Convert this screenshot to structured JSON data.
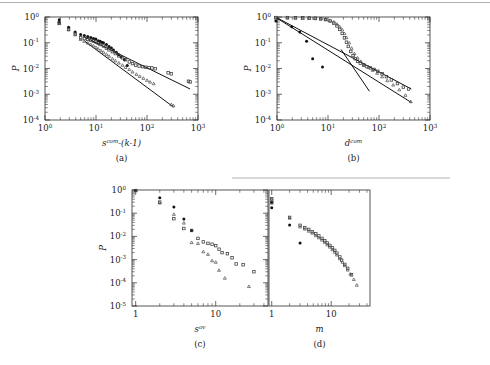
{
  "figure": {
    "background": "#ffffff",
    "ink_color": "#1a1a1a",
    "panels": [
      "a",
      "b",
      "c",
      "d"
    ]
  },
  "panel_a": {
    "label": "(a)",
    "xlabel_base": "s",
    "xlabel_sup": "com",
    "xlabel_rest": "-(k-1)",
    "ylabel": "P",
    "xticks": [
      "10",
      "10",
      "10",
      "10"
    ],
    "xtick_sups": [
      "0",
      "1",
      "2",
      "3"
    ],
    "yticks": [
      "10",
      "10",
      "10",
      "10",
      "10"
    ],
    "ytick_sups": [
      "0",
      "-1",
      "-2",
      "-3",
      "-4"
    ]
  },
  "panel_b": {
    "label": "(b)",
    "xlabel_base": "d",
    "xlabel_sup": "com",
    "xlabel_rest": "",
    "ylabel": "P",
    "xticks": [
      "10",
      "10",
      "10",
      "10"
    ],
    "xtick_sups": [
      "0",
      "1",
      "2",
      "3"
    ],
    "yticks": [
      "10",
      "10",
      "10",
      "10",
      "10"
    ],
    "ytick_sups": [
      "0",
      "-1",
      "-2",
      "-3",
      "-4"
    ]
  },
  "panel_c": {
    "label": "(c)",
    "xlabel_base": "s",
    "xlabel_sup": "ov",
    "xlabel_rest": "",
    "ylabel": "P",
    "xticks": [
      "1",
      "10"
    ],
    "xtick_sups": [
      "",
      ""
    ],
    "yticks": [
      "10",
      "10",
      "10",
      "10",
      "10",
      "10"
    ],
    "ytick_sups": [
      "0",
      "-1",
      "-2",
      "-3",
      "-4",
      "-5"
    ]
  },
  "panel_d": {
    "label": "(d)",
    "xlabel_base": "m",
    "xlabel_sup": "",
    "xlabel_rest": "",
    "ylabel": "",
    "xticks": [
      "1",
      "10"
    ],
    "xtick_sups": [
      "",
      ""
    ],
    "yticks": [],
    "ytick_sups": []
  },
  "chart_data": [
    {
      "id": "a",
      "type": "scatter",
      "title": "",
      "xlabel": "s^com-(k-1)",
      "ylabel": "P",
      "xscale": "log",
      "yscale": "log",
      "xlim": [
        1,
        1000
      ],
      "ylim": [
        0.0001,
        1
      ],
      "grid": false,
      "legend": "none",
      "series": [
        {
          "name": "filled-circle",
          "marker": "filled circle",
          "x": [
            1.9,
            1.9,
            2.9,
            3.9,
            5.0,
            5.9,
            6.9,
            7.9,
            8.9,
            9.9,
            11,
            12,
            13,
            14,
            16,
            18,
            20,
            22,
            25,
            28,
            31,
            36,
            41
          ],
          "y": [
            0.78,
            0.62,
            0.4,
            0.26,
            0.21,
            0.19,
            0.175,
            0.16,
            0.145,
            0.14,
            0.12,
            0.115,
            0.105,
            0.1,
            0.085,
            0.072,
            0.062,
            0.052,
            0.043,
            0.034,
            0.028,
            0.022,
            0.013
          ]
        },
        {
          "name": "open-square",
          "marker": "open square",
          "x": [
            1.9,
            2.9,
            3.9,
            5.0,
            5.9,
            6.9,
            7.9,
            8.9,
            10,
            11,
            12,
            14,
            16,
            18,
            21,
            24,
            28,
            33,
            38,
            45,
            52,
            60,
            70,
            82,
            95,
            110,
            125,
            145,
            260,
            300,
            650,
            700
          ],
          "y": [
            0.58,
            0.33,
            0.22,
            0.155,
            0.145,
            0.135,
            0.125,
            0.115,
            0.105,
            0.095,
            0.085,
            0.075,
            0.062,
            0.053,
            0.045,
            0.038,
            0.031,
            0.026,
            0.022,
            0.018,
            0.0155,
            0.0135,
            0.0125,
            0.0118,
            0.0112,
            0.0108,
            0.0105,
            0.0098,
            0.0068,
            0.0062,
            0.0032,
            0.003
          ]
        },
        {
          "name": "open-triangle",
          "marker": "open triangle",
          "x": [
            1.9,
            2.9,
            3.9,
            5.0,
            5.9,
            6.9,
            7.9,
            8.9,
            10,
            11,
            12.5,
            14,
            16,
            18,
            21,
            24,
            28,
            33,
            38,
            45,
            52,
            62,
            72,
            85,
            100,
            115,
            135,
            300,
            330
          ],
          "y": [
            0.56,
            0.32,
            0.205,
            0.135,
            0.115,
            0.098,
            0.086,
            0.076,
            0.066,
            0.058,
            0.05,
            0.043,
            0.036,
            0.03,
            0.024,
            0.02,
            0.0165,
            0.0135,
            0.0112,
            0.0092,
            0.0074,
            0.006,
            0.005,
            0.0042,
            0.0035,
            0.003,
            0.0026,
            0.0004,
            0.00036
          ]
        }
      ],
      "fits": [
        {
          "name": "upper-fit",
          "x1": 6.0,
          "y1": 0.165,
          "x2": 700,
          "y2": 0.0016,
          "slope": -0.98
        },
        {
          "name": "lower-fit",
          "x1": 6.0,
          "y1": 0.115,
          "x2": 330,
          "y2": 0.00032,
          "slope": -1.46
        }
      ]
    },
    {
      "id": "b",
      "type": "scatter",
      "title": "",
      "xlabel": "d^com",
      "ylabel": "P",
      "xscale": "log",
      "yscale": "log",
      "xlim": [
        1,
        1000
      ],
      "ylim": [
        0.0001,
        1
      ],
      "grid": false,
      "legend": "none",
      "series": [
        {
          "name": "filled-circle",
          "marker": "filled circle",
          "x": [
            0.95,
            1.95,
            2.8,
            3.8,
            5.0,
            7.8
          ],
          "y": [
            0.7,
            0.42,
            0.26,
            0.115,
            0.024,
            0.0115
          ]
        },
        {
          "name": "open-square",
          "marker": "open square",
          "x": [
            0.95,
            1.6,
            2.3,
            3.2,
            4.3,
            5.6,
            7.2,
            9.0,
            11,
            13,
            15,
            17,
            19,
            21,
            23,
            25,
            28,
            31,
            34,
            38,
            43,
            50,
            58,
            68,
            80,
            95,
            115,
            140,
            175,
            230,
            300,
            380
          ],
          "y": [
            0.95,
            0.95,
            0.94,
            0.93,
            0.92,
            0.9,
            0.86,
            0.8,
            0.7,
            0.58,
            0.45,
            0.33,
            0.23,
            0.155,
            0.105,
            0.072,
            0.046,
            0.032,
            0.024,
            0.019,
            0.016,
            0.0135,
            0.0118,
            0.0105,
            0.0092,
            0.0078,
            0.0062,
            0.0048,
            0.0036,
            0.0026,
            0.0019,
            0.0016
          ]
        },
        {
          "name": "open-triangle",
          "marker": "open triangle",
          "x": [
            0.95,
            1.6,
            2.3,
            3.2,
            4.3,
            5.6,
            7.2,
            9.0,
            11,
            13,
            15,
            17,
            19,
            21,
            23,
            26,
            29,
            33,
            38,
            44,
            52,
            62,
            75,
            92,
            115,
            145,
            190,
            250,
            330,
            420
          ],
          "y": [
            0.92,
            0.92,
            0.91,
            0.9,
            0.89,
            0.87,
            0.84,
            0.8,
            0.73,
            0.64,
            0.53,
            0.42,
            0.32,
            0.23,
            0.16,
            0.1,
            0.062,
            0.038,
            0.026,
            0.019,
            0.0145,
            0.0112,
            0.0086,
            0.0066,
            0.0048,
            0.0034,
            0.0023,
            0.0015,
            0.00092,
            0.00052
          ]
        }
      ],
      "fits": [
        {
          "name": "upper-fit",
          "x1": 1.0,
          "y1": 0.93,
          "x2": 430,
          "y2": 0.0016,
          "slope": -1.05
        },
        {
          "name": "lower-fit",
          "x1": 1.0,
          "y1": 0.9,
          "x2": 430,
          "y2": 0.00048,
          "slope": -1.24
        },
        {
          "name": "steep-fit",
          "x1": 18,
          "y1": 0.055,
          "x2": 65,
          "y2": 0.0013,
          "slope": -2.9
        }
      ]
    },
    {
      "id": "c",
      "type": "scatter",
      "title": "",
      "xlabel": "s^ov",
      "ylabel": "P",
      "xscale": "log",
      "yscale": "log",
      "xlim": [
        0.9,
        45
      ],
      "ylim": [
        1e-05,
        1
      ],
      "grid": false,
      "legend": "none",
      "series": [
        {
          "name": "filled-circle",
          "marker": "filled circle",
          "x": [
            1.0,
            2.0,
            3.0,
            4.0,
            5.0
          ],
          "y": [
            0.95,
            0.46,
            0.185,
            0.056,
            0.018
          ]
        },
        {
          "name": "open-square",
          "marker": "open square",
          "x": [
            1.0,
            2.0,
            3.0,
            4.0,
            5.0,
            6.0,
            7.0,
            8.0,
            9.0,
            10,
            11,
            12,
            14,
            16,
            18,
            22,
            30
          ],
          "y": [
            0.95,
            0.3,
            0.058,
            0.022,
            0.018,
            0.0082,
            0.0058,
            0.005,
            0.0046,
            0.004,
            0.0028,
            0.002,
            0.0018,
            0.0012,
            0.00065,
            0.0006,
            0.0003
          ]
        },
        {
          "name": "open-triangle",
          "marker": "open triangle",
          "x": [
            1.0,
            2.0,
            3.0,
            4.0,
            5.0,
            6.0,
            7.0,
            8.0,
            9.0,
            10,
            11,
            13,
            26
          ],
          "y": [
            0.95,
            0.28,
            0.09,
            0.038,
            0.0055,
            0.005,
            0.0022,
            0.0017,
            0.0009,
            0.00078,
            0.00035,
            0.00016,
            7e-05
          ]
        }
      ],
      "fits": []
    },
    {
      "id": "d",
      "type": "scatter",
      "title": "",
      "xlabel": "m",
      "ylabel": "P",
      "xscale": "log",
      "yscale": "log",
      "xlim": [
        0.9,
        45
      ],
      "ylim": [
        1e-05,
        1
      ],
      "grid": false,
      "legend": "none",
      "series": [
        {
          "name": "filled-circle",
          "marker": "filled circle",
          "x": [
            1.0,
            1.0,
            2.0,
            3.0
          ],
          "y": [
            0.3,
            0.17,
            0.031,
            0.0052
          ]
        },
        {
          "name": "open-square",
          "marker": "open square",
          "x": [
            1.0,
            1.0,
            2.0,
            3.0,
            3.6,
            4.2,
            4.8,
            5.5,
            6.2,
            7.0,
            7.8,
            8.6,
            9.5,
            10.5,
            11.5,
            12.5,
            14,
            15,
            17,
            19,
            22
          ],
          "y": [
            0.42,
            0.28,
            0.066,
            0.03,
            0.024,
            0.02,
            0.016,
            0.013,
            0.0105,
            0.0082,
            0.0065,
            0.0052,
            0.0041,
            0.0032,
            0.0025,
            0.0019,
            0.0013,
            0.00095,
            0.00062,
            0.00042,
            0.00022
          ]
        },
        {
          "name": "open-triangle",
          "marker": "open triangle",
          "x": [
            1.0,
            2.0,
            3.0,
            3.6,
            4.2,
            4.8,
            5.5,
            6.2,
            7.0,
            7.8,
            8.6,
            9.5,
            10.5,
            11.5,
            12.5,
            14,
            15.5,
            17,
            19,
            21,
            24,
            27
          ],
          "y": [
            0.4,
            0.062,
            0.026,
            0.021,
            0.017,
            0.014,
            0.011,
            0.0088,
            0.007,
            0.0056,
            0.0044,
            0.0035,
            0.0027,
            0.0021,
            0.0016,
            0.0011,
            0.00078,
            0.00055,
            0.00036,
            0.00024,
            0.00014,
            8e-05
          ]
        }
      ],
      "fits": []
    }
  ]
}
